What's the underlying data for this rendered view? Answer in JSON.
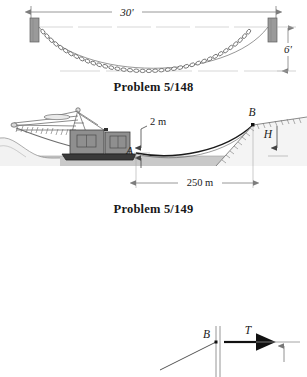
{
  "document": {
    "type": "textbook-figure-page",
    "background_color": "#ffffff",
    "ink_color": "#1a1a1a"
  },
  "figures": [
    {
      "id": "figure-148",
      "caption": "Problem 5/148",
      "description": "Chain hanging as a catenary between two wall brackets",
      "dimensions": [
        {
          "name": "span",
          "label": "30'",
          "orientation": "horizontal",
          "value": 30,
          "unit": "ft"
        },
        {
          "name": "sag",
          "label": "6'",
          "orientation": "vertical",
          "value": 6,
          "unit": "ft"
        }
      ],
      "elements": [
        {
          "name": "left-support-block",
          "fill": "#9a9a9a"
        },
        {
          "name": "right-support-block",
          "fill": "#9a9a9a"
        },
        {
          "name": "chain-catenary",
          "links": 46
        }
      ]
    },
    {
      "id": "figure-149",
      "caption": "Problem 5/149",
      "description": "Dredge on water pulling a cable to anchor point B on the shore",
      "labels": [
        {
          "name": "point-a-label",
          "text": "A"
        },
        {
          "name": "point-b-label",
          "text": "B"
        },
        {
          "name": "depth-h-label",
          "text": "H"
        }
      ],
      "dimensions": [
        {
          "name": "cable-sag",
          "label": "2 m",
          "orientation": "vertical",
          "value": 2,
          "unit": "m"
        },
        {
          "name": "horizontal-span",
          "label": "250 m",
          "orientation": "horizontal",
          "value": 250,
          "unit": "m"
        }
      ],
      "elements": [
        {
          "name": "dredge-hull",
          "fill": "#3a3a3a"
        },
        {
          "name": "dredge-cabin",
          "fill": "#8f8f8f"
        },
        {
          "name": "dredge-boom",
          "fill": "#d8d8d8"
        },
        {
          "name": "water-band",
          "fill": "#c9c9c9"
        },
        {
          "name": "cable-curve",
          "stroke": "#1a1a1a"
        },
        {
          "name": "shore-slope-left",
          "fill": "#efefef"
        },
        {
          "name": "shore-slope-right",
          "fill": "#efefef"
        }
      ]
    },
    {
      "id": "figure-150",
      "caption": "",
      "description": "Partial free-body diagram at point B showing cable tension T",
      "labels": [
        {
          "name": "point-b-label",
          "text": "B"
        },
        {
          "name": "tension-label",
          "text": "T"
        }
      ],
      "elements": [
        {
          "name": "vertical-post",
          "stroke": "#8a8a8a"
        },
        {
          "name": "tension-arrow",
          "stroke": "#111111"
        },
        {
          "name": "cable-segment",
          "stroke": "#555555"
        },
        {
          "name": "ground-line",
          "stroke": "#777777"
        },
        {
          "name": "up-arrow",
          "stroke": "#777777"
        }
      ]
    }
  ],
  "colors": {
    "ink": "#1a1a1a",
    "dim_line": "#7d7d7d",
    "support_gray": "#9a9a9a",
    "water_gray": "#c9c9c9",
    "hull_dark": "#3a3a3a",
    "cabin_gray": "#8f8f8f"
  }
}
